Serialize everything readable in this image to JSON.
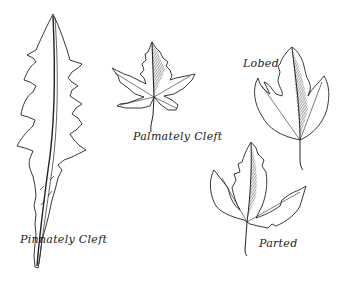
{
  "figure": {
    "background": "#ffffff",
    "ink_color": "#222222",
    "leaves": [
      {
        "id": "pinnately-cleft",
        "label": "Pinnately Cleft"
      },
      {
        "id": "palmately-cleft",
        "label": "Palmately Cleft"
      },
      {
        "id": "lobed",
        "label": "Lobed"
      },
      {
        "id": "parted",
        "label": "Parted"
      }
    ]
  }
}
